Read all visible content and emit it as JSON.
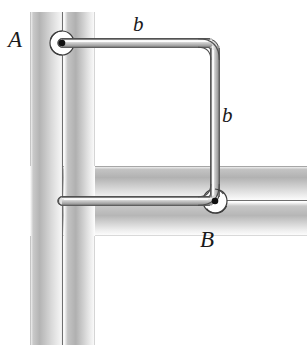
{
  "figure": {
    "type": "mechanics-line-diagram",
    "width": 307,
    "height": 352,
    "background_color": "#ffffff"
  },
  "labels": {
    "joint_a": "A",
    "joint_b": "B",
    "side_top": "b",
    "side_right": "b"
  },
  "geometry": {
    "vertical_shaft": {
      "name": "vertical-shaft",
      "x_left": 30,
      "x_right": 95,
      "y_top": 12,
      "y_bottom": 345,
      "axis_line_x": 62
    },
    "horizontal_shaft": {
      "name": "horizontal-shaft",
      "x_left": 62,
      "x_right": 307,
      "y_top": 166,
      "y_bottom": 236,
      "axis_line_y": 201
    },
    "square_loop": {
      "name": "square-rod-loop",
      "corner_a": [
        62,
        43
      ],
      "corner_top_right": [
        215,
        43
      ],
      "corner_b": [
        215,
        201
      ],
      "corner_bottom_left": [
        62,
        201
      ],
      "side_length_label": "b",
      "rod_thickness": 7,
      "corner_radius": 9
    },
    "pivot_points": [
      {
        "name": "pivot-a",
        "label": "A",
        "x": 62,
        "y": 43
      },
      {
        "name": "pivot-b",
        "label": "B",
        "x": 215,
        "y": 201
      }
    ]
  },
  "colors": {
    "shaft_light": "#f4f4f4",
    "shaft_mid": "#d8d8d8",
    "shaft_dark": "#9a9a9a",
    "rod_outline": "#4a4a4a",
    "rod_fill_light": "#f2f2f2",
    "rod_fill_mid": "#c8c8c8",
    "rod_fill_dark": "#8e8e8e",
    "label_text": "#1a1a1a",
    "pivot_dot": "#111111"
  }
}
